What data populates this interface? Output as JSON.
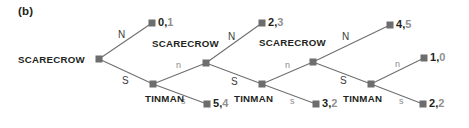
{
  "figure": {
    "panel_label": "(b)",
    "type": "extensive-form-game-tree"
  },
  "nodes": [
    {
      "id": "n0",
      "player": "SCARECROW",
      "x": 99,
      "y": 59,
      "label_side": "left"
    },
    {
      "id": "n1",
      "player": "TINMAN",
      "x": 153,
      "y": 84,
      "label_side": "below-left"
    },
    {
      "id": "n2",
      "player": "SCARECROW",
      "x": 206,
      "y": 63,
      "label_side": "above"
    },
    {
      "id": "n3",
      "player": "TINMAN",
      "x": 262,
      "y": 84,
      "label_side": "below-left"
    },
    {
      "id": "n4",
      "player": "SCARECROW",
      "x": 313,
      "y": 62,
      "label_side": "above"
    },
    {
      "id": "n5",
      "player": "TINMAN",
      "x": 371,
      "y": 84,
      "label_side": "below-left"
    }
  ],
  "terminals": [
    {
      "id": "t0",
      "x": 152,
      "y": 23,
      "payoff1": "0",
      "payoff2": "1"
    },
    {
      "id": "t1",
      "x": 207,
      "y": 104,
      "payoff1": "5",
      "payoff2": "4"
    },
    {
      "id": "t2",
      "x": 262,
      "y": 23,
      "payoff1": "2",
      "payoff2": "3"
    },
    {
      "id": "t3",
      "x": 316,
      "y": 104,
      "payoff1": "3",
      "payoff2": "2"
    },
    {
      "id": "t4",
      "x": 390,
      "y": 25,
      "payoff1": "4",
      "payoff2": "5"
    },
    {
      "id": "t5",
      "x": 424,
      "y": 58,
      "payoff1": "1",
      "payoff2": "0"
    },
    {
      "id": "t6",
      "x": 423,
      "y": 104,
      "payoff1": "2",
      "payoff2": "2"
    }
  ],
  "edges": [
    {
      "from": "n0",
      "to": "t0",
      "label": "N",
      "label_x": 118,
      "label_y": 30,
      "style": "upper"
    },
    {
      "from": "n0",
      "to": "n1",
      "label": "S",
      "label_x": 122,
      "label_y": 76,
      "style": "upper"
    },
    {
      "from": "n1",
      "to": "n2",
      "label": "n",
      "label_x": 176,
      "label_y": 61,
      "style": "lower"
    },
    {
      "from": "n1",
      "to": "t1",
      "label": "s",
      "label_x": 181,
      "label_y": 97,
      "style": "lower"
    },
    {
      "from": "n2",
      "to": "t2",
      "label": "N",
      "label_x": 228,
      "label_y": 32,
      "style": "upper"
    },
    {
      "from": "n2",
      "to": "n3",
      "label": "S",
      "label_x": 231,
      "label_y": 77,
      "style": "upper"
    },
    {
      "from": "n3",
      "to": "n4",
      "label": "n",
      "label_x": 285,
      "label_y": 61,
      "style": "lower"
    },
    {
      "from": "n3",
      "to": "t3",
      "label": "s",
      "label_x": 290,
      "label_y": 97,
      "style": "lower"
    },
    {
      "from": "n4",
      "to": "t4",
      "label": "N",
      "label_x": 342,
      "label_y": 32,
      "style": "upper"
    },
    {
      "from": "n4",
      "to": "n5",
      "label": "S",
      "label_x": 340,
      "label_y": 76,
      "style": "upper"
    },
    {
      "from": "n5",
      "to": "t5",
      "label": "n",
      "label_x": 395,
      "label_y": 60,
      "style": "lower"
    },
    {
      "from": "n5",
      "to": "t6",
      "label": "s",
      "label_x": 399,
      "label_y": 97,
      "style": "lower"
    }
  ],
  "player_labels": [
    {
      "text": "SCARECROW",
      "x": 18,
      "y": 55
    },
    {
      "text": "TINMAN",
      "x": 145,
      "y": 94
    },
    {
      "text": "SCARECROW",
      "x": 152,
      "y": 39
    },
    {
      "text": "TINMAN",
      "x": 234,
      "y": 94
    },
    {
      "text": "SCARECROW",
      "x": 259,
      "y": 38
    },
    {
      "text": "TINMAN",
      "x": 343,
      "y": 94
    }
  ],
  "colors": {
    "node_fill": "#6d6d6d",
    "edge_stroke": "#6f6f6f",
    "text_dark": "#231f20",
    "text_gray": "#8f8f8f",
    "background": "#ffffff"
  }
}
